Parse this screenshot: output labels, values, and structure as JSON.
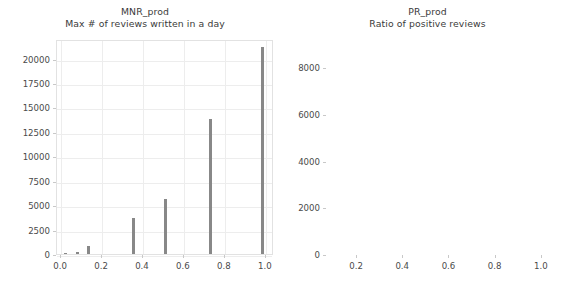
{
  "figure": {
    "width": 565,
    "height": 291,
    "background": "#ffffff",
    "bar_color": "#888888",
    "grid_color": "#ededed",
    "axes_border_color": "#e2e2e2",
    "tick_label_color": "#4a4a4a",
    "title_color": "#3a3a3a"
  },
  "chart_data": [
    {
      "type": "bar",
      "id": "MNR_prod",
      "title": "MNR_prod",
      "subtitle": "Max # of reviews written in a day",
      "xlabel": "",
      "ylabel": "",
      "xlim": [
        -0.02,
        1.04
      ],
      "ylim": [
        0,
        22000
      ],
      "grid": true,
      "legend": "none",
      "xticks": [
        "0.0",
        "0.2",
        "0.4",
        "0.6",
        "0.8",
        "1.0"
      ],
      "xtick_values": [
        0.0,
        0.2,
        0.4,
        0.6,
        0.8,
        1.0
      ],
      "yticks": [
        "0",
        "2500",
        "5000",
        "7500",
        "10000",
        "12500",
        "15000",
        "17500",
        "20000"
      ],
      "ytick_values": [
        0,
        2500,
        5000,
        7500,
        10000,
        12500,
        15000,
        17500,
        20000
      ],
      "x": [
        0.02,
        0.08,
        0.135,
        0.355,
        0.51,
        0.73,
        0.985
      ],
      "values": [
        110,
        230,
        830,
        3720,
        5600,
        13800,
        21200
      ],
      "bar_width": 0.016
    },
    {
      "type": "bar",
      "id": "PR_prod",
      "title": "PR_prod",
      "subtitle": "Ratio of positive reviews",
      "xlabel": "",
      "ylabel": "",
      "xlim": [
        0.07,
        1.035
      ],
      "ylim": [
        0,
        9200
      ],
      "grid": true,
      "legend": "none",
      "xticks": [
        "0.2",
        "0.4",
        "0.6",
        "0.8",
        "1.0"
      ],
      "xtick_values": [
        0.2,
        0.4,
        0.6,
        0.8,
        1.0
      ],
      "yticks": [
        "0",
        "2000",
        "4000",
        "6000",
        "8000"
      ],
      "ytick_values": [
        0,
        2000,
        4000,
        6000,
        8000
      ],
      "x": [
        0.1,
        0.115,
        0.13,
        0.145,
        0.16,
        0.175,
        0.19,
        0.205,
        0.22,
        0.235,
        0.25,
        0.265,
        0.28,
        0.295,
        0.31,
        0.325,
        0.34,
        0.355,
        0.37,
        0.385,
        0.4,
        0.415,
        0.43,
        0.445,
        0.49,
        0.505,
        0.52,
        0.535,
        0.55,
        0.565,
        0.58,
        0.595,
        0.61,
        0.625,
        0.64,
        0.655,
        0.67,
        0.685,
        0.7,
        0.715,
        0.73,
        0.745,
        0.76,
        0.775,
        0.79,
        0.805,
        0.82,
        0.835,
        0.85,
        0.89,
        0.905,
        0.92,
        0.935,
        0.95,
        0.965,
        0.98
      ],
      "values": [
        8750,
        650,
        1500,
        620,
        900,
        260,
        160,
        150,
        200,
        700,
        690,
        250,
        310,
        420,
        230,
        530,
        1200,
        180,
        150,
        230,
        220,
        900,
        1250,
        180,
        190,
        320,
        500,
        870,
        230,
        290,
        980,
        980,
        1020,
        470,
        880,
        1400,
        1100,
        1080,
        240,
        480,
        520,
        880,
        320,
        870,
        1700,
        1050,
        920,
        1520,
        150,
        2720,
        840,
        700,
        420,
        1200,
        1930,
        1680
      ],
      "bar_width": 0.0115
    }
  ]
}
